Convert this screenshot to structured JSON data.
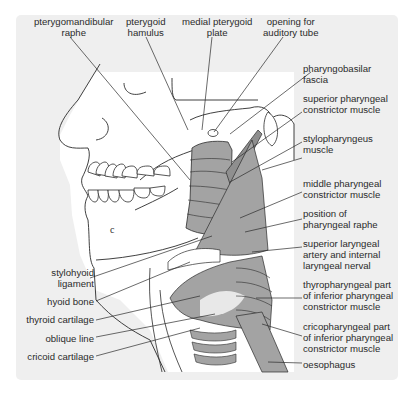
{
  "figure": {
    "colors": {
      "panel_bg": "#efefef",
      "head_fill": "#ffffff",
      "muscle_fill": "#a3a3a3",
      "muscle_dark": "#8f8f8f",
      "line": "#2b2b2b"
    }
  },
  "labels": {
    "top": [
      {
        "id": "pterygomandibular-raphe",
        "lines": [
          "pterygomandibular",
          "raphe"
        ]
      },
      {
        "id": "pterygoid-hamulus",
        "lines": [
          "pterygoid",
          "hamulus"
        ]
      },
      {
        "id": "medial-pterygoid-plate",
        "lines": [
          "medial pterygoid",
          "plate"
        ]
      },
      {
        "id": "opening-for-auditory-tube",
        "lines": [
          "opening for",
          "auditory tube"
        ]
      }
    ],
    "right": [
      {
        "id": "pharyngobasilar-fascia",
        "lines": [
          "pharyngobasilar",
          "fascia"
        ]
      },
      {
        "id": "superior-pharyngeal-constrictor",
        "lines": [
          "superior pharyngeal",
          "constrictor muscle"
        ]
      },
      {
        "id": "stylopharyngeus",
        "lines": [
          "stylopharyngeus",
          "muscle"
        ]
      },
      {
        "id": "middle-pharyngeal-constrictor",
        "lines": [
          "middle pharyngeal",
          "constrictor muscle"
        ]
      },
      {
        "id": "pharyngeal-raphe",
        "lines": [
          "position of",
          "pharyngeal raphe"
        ]
      },
      {
        "id": "superior-laryngeal",
        "lines": [
          "superior laryngeal",
          "artery and internal",
          "laryngeal nerval"
        ]
      },
      {
        "id": "thyropharyngeal",
        "lines": [
          "thyropharyngeal part",
          "of inferior pharyngeal",
          "constrictor muscle"
        ]
      },
      {
        "id": "cricopharyngeal",
        "lines": [
          "cricopharyngeal part",
          "of inferior pharyngeal",
          "constrictor muscle"
        ]
      },
      {
        "id": "oesophagus",
        "lines": [
          "oesophagus"
        ]
      }
    ],
    "left": [
      {
        "id": "stylohyoid-ligament",
        "lines": [
          "stylohyoid",
          "ligament"
        ]
      },
      {
        "id": "hyoid-bone",
        "lines": [
          "hyoid bone"
        ]
      },
      {
        "id": "thyroid-cartilage",
        "lines": [
          "thyroid cartilage"
        ]
      },
      {
        "id": "oblique-line",
        "lines": [
          "oblique line"
        ]
      },
      {
        "id": "cricoid-cartilage",
        "lines": [
          "cricoid cartilage"
        ]
      }
    ]
  }
}
